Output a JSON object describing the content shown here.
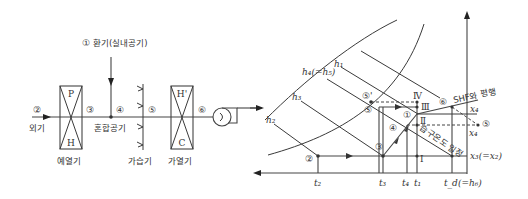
{
  "schematic": {
    "return_air": {
      "marker": "①",
      "label": "환기(실내공기)"
    },
    "outdoor_air": {
      "marker": "②",
      "label": "외기"
    },
    "point_3": "③",
    "point_4": "④",
    "point_5": "⑤",
    "point_6": "⑥",
    "mixed_air_label": "혼합공기",
    "preheater": {
      "top": "P",
      "bottom": "H",
      "label": "예열기"
    },
    "humidifier": {
      "label": "가습기"
    },
    "reheater": {
      "top": "H'",
      "bottom": "C",
      "label": "가열기"
    }
  },
  "chart": {
    "enthalpy_labels": {
      "h1": "h₁",
      "h4": "h₄(=h₅)",
      "h3": "h₃",
      "h2": "h₂"
    },
    "points": {
      "p1": "①",
      "p2": "②",
      "p3": "③",
      "p4": "④",
      "p5": "⑤",
      "p5prime": "⑤'",
      "p5right": "⑤",
      "p6": "⑥"
    },
    "roman": {
      "I": "Ⅰ",
      "II": "Ⅱ",
      "III": "Ⅲ",
      "IV": "Ⅳ"
    },
    "annotations": {
      "shf_parallel": "SHF와 평행",
      "wet_bulb_const": "습구온도 일정"
    },
    "x_labels": {
      "t2": "t₂",
      "t3": "t₃",
      "t4": "t₄",
      "t1": "t₁",
      "td": "t_d(=h₆)"
    },
    "y_labels": {
      "x4_upper": "x₄",
      "x4_lower": "x₄",
      "x3": "x₃(=x₂)"
    }
  }
}
